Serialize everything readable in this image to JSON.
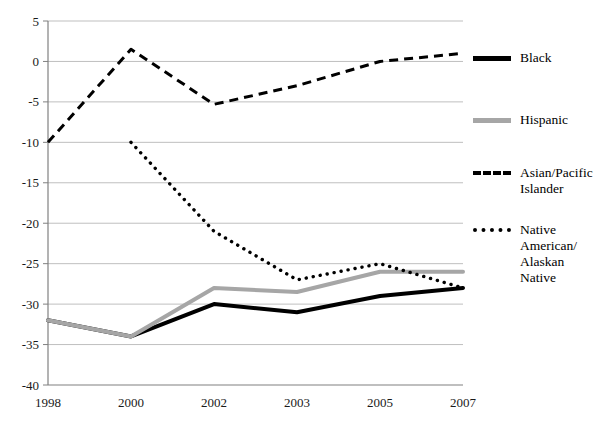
{
  "chart_data": {
    "type": "line",
    "title": "",
    "subtitle": "",
    "xlabel": "",
    "ylabel": "",
    "categories": [
      "1998",
      "2000",
      "2002",
      "2003",
      "2005",
      "2007"
    ],
    "ylim": [
      -40,
      5
    ],
    "yticks": [
      "5",
      "0",
      "-5",
      "-10",
      "-15",
      "-20",
      "-25",
      "-30",
      "-35",
      "-40"
    ],
    "ytick_values": [
      5,
      0,
      -5,
      -10,
      -15,
      -20,
      -25,
      -30,
      -35,
      -40
    ],
    "grid": true,
    "legend_position": "right",
    "series": [
      {
        "name": "Black",
        "style": "solid",
        "color": "#000000",
        "width": 4,
        "values": [
          -32,
          -34,
          -30,
          -31,
          -29,
          -28
        ]
      },
      {
        "name": "Hispanic",
        "style": "solid",
        "color": "#A6A6A6",
        "width": 4,
        "values": [
          -32,
          -34,
          -28,
          -28.5,
          -26,
          -26
        ]
      },
      {
        "name": "Asian/Pacific Islander",
        "style": "dashed",
        "color": "#000000",
        "width": 3,
        "values": [
          -10,
          1.5,
          -5.3,
          -3,
          0,
          1
        ]
      },
      {
        "name": "Native American/Alaskan Native",
        "style": "dotted",
        "color": "#000000",
        "width": 3,
        "values": [
          null,
          -10,
          -21,
          -27,
          -25,
          -28
        ]
      }
    ]
  },
  "legend": {
    "items": [
      {
        "label": "Black",
        "marker": "solid-black-line"
      },
      {
        "label": "Hispanic",
        "marker": "solid-gray-line"
      },
      {
        "label": "Asian/Pacific\nIslander",
        "marker": "dashed-line"
      },
      {
        "label": "Native\nAmerican/\nAlaskan\nNative",
        "marker": "dotted-line"
      }
    ]
  },
  "colors": {
    "black_series": "#000000",
    "hispanic_series": "#A6A6A6",
    "gridline": "#BFBFBF",
    "axis": "#808080",
    "text": "#111111",
    "background": "#FFFFFF"
  }
}
